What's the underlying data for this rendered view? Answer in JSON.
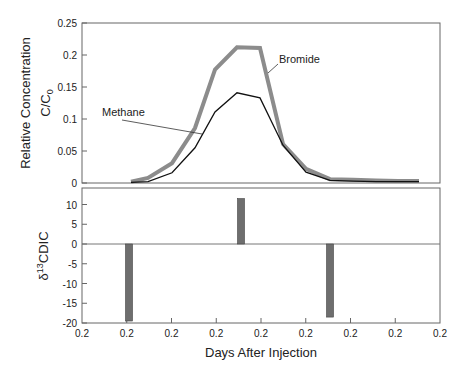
{
  "chart_data": [
    {
      "type": "line",
      "panel": "top",
      "title": "",
      "xlabel": "Days After Injection",
      "ylabel": "Relative Concentration",
      "ylabel_sub": "C/C0",
      "ylim": [
        0,
        0.25
      ],
      "yticks": [
        "0",
        "0.05",
        "0.1",
        "0.15",
        "0.2",
        "0.25"
      ],
      "grid": false,
      "x_px": [
        131,
        148,
        172,
        195,
        215,
        237,
        260,
        283,
        306,
        330,
        353,
        376,
        398,
        419
      ],
      "series": [
        {
          "name": "Bromide",
          "color": "#8c8c8c",
          "width": 4,
          "values": [
            0.002,
            0.008,
            0.031,
            0.086,
            0.177,
            0.212,
            0.211,
            0.061,
            0.022,
            0.006,
            0.005,
            0.004,
            0.003,
            0.003
          ]
        },
        {
          "name": "Methane",
          "color": "#111111",
          "width": 1.3,
          "values": [
            0.001,
            0.002,
            0.016,
            0.055,
            0.111,
            0.141,
            0.133,
            0.059,
            0.017,
            0.004,
            0.003,
            0.002,
            0.002,
            0.002
          ]
        }
      ],
      "annotations": [
        {
          "text": "Methane",
          "label_x": 102,
          "label_y": 116,
          "arrow_to": [
            202,
            134
          ]
        },
        {
          "text": "Bromide",
          "label_x": 279,
          "label_y": 63,
          "arrow_to": [
            268,
            73
          ]
        }
      ]
    },
    {
      "type": "bar",
      "panel": "bottom",
      "xlabel": "Days After Injection",
      "ylabel": "δ13CDIC",
      "ylim": [
        -20,
        13
      ],
      "yticks": [
        "10",
        "5",
        "0",
        "-5",
        "-10",
        "-15",
        "-20"
      ],
      "xticks": [
        "0.2",
        "0.2",
        "0.2",
        "0.2",
        "0.2",
        "0.2",
        "0.2",
        "0.2",
        "0.2"
      ],
      "grid": false,
      "bar_color": "#6e6e6e",
      "bars": [
        {
          "x_px": 129,
          "value": -19.5
        },
        {
          "x_px": 241,
          "value": 11.5
        },
        {
          "x_px": 330,
          "value": -18.5
        }
      ]
    }
  ],
  "labels": {
    "y_top_line1": "Relative Concentration",
    "y_top_line2": "C/C",
    "y_top_sub": "0",
    "y_bottom_delta": "δ",
    "y_bottom_sup": "13",
    "y_bottom_rest": "CDIC",
    "x_axis": "Days After Injection"
  }
}
